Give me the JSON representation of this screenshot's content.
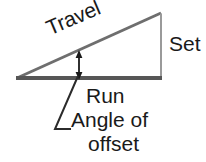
{
  "diagram": {
    "labels": {
      "travel": "Travel",
      "set": "Set",
      "run": "Run",
      "angle_of": "Angle of",
      "offset": "offset"
    },
    "colors": {
      "background": "#ffffff",
      "text": "#1a1a1a",
      "base_line": "#565656",
      "hypotenuse_line": "#6e6e6e",
      "vertical_line": "#9a9a9a",
      "leader_line": "#2b2b2b",
      "arrow": "#1a1a1a"
    },
    "geometry": {
      "left_vertex": [
        17,
        78
      ],
      "apex": [
        161,
        13
      ],
      "bottom_right_vertex": [
        161,
        78
      ],
      "base_line": {
        "x1": 16,
        "y1": 78,
        "x2": 161,
        "y2": 78,
        "width": 4
      },
      "hypotenuse": {
        "x1": 17,
        "y1": 78,
        "x2": 161,
        "y2": 13,
        "width": 3
      },
      "vertical_set_line": {
        "x1": 161,
        "y1": 13,
        "x2": 161,
        "y2": 78,
        "width": 2
      },
      "angle_arrow": {
        "x": 79,
        "y_top": 52,
        "y_bottom": 78,
        "width": 2
      },
      "leader_line": {
        "points": "78,76 55,129 71,129",
        "width": 2
      },
      "travel_label_rotation_deg": -23
    }
  }
}
